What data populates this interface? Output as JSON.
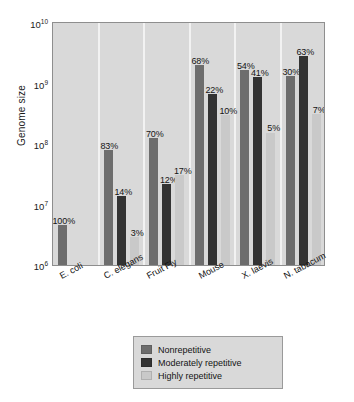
{
  "chart_data": {
    "type": "bar",
    "title": "",
    "xlabel": "",
    "ylabel": "Genome size",
    "yscale": "log",
    "ylim": [
      1000000,
      10000000000
    ],
    "ytick_labels": [
      "10^10",
      "10^9",
      "10^8",
      "10^7",
      "10^6"
    ],
    "ytick_mantissa": [
      "10",
      "10",
      "10",
      "10",
      "10"
    ],
    "ytick_exponent": [
      "10",
      "9",
      "8",
      "7",
      "6"
    ],
    "grid": false,
    "legend_position": "bottom-center",
    "categories": [
      "E. coli",
      "C. elegans",
      "Fruit Fly",
      "Mouse",
      "X. laevis",
      "N. tabacum"
    ],
    "genome_sizes": [
      4600000,
      97000000,
      180000000,
      3000000000,
      3100000000,
      4500000000
    ],
    "series": [
      {
        "name": "Nonrepetitive",
        "color": "#6d6d6d",
        "percent_labels": [
          "100%",
          "83%",
          "70%",
          "68%",
          "54%",
          "30%"
        ],
        "percents": [
          100,
          83,
          70,
          68,
          54,
          30
        ],
        "values": [
          4600000,
          80500000,
          126000000,
          2040000000,
          1674000000,
          1350000000
        ]
      },
      {
        "name": "Moderately repetitive",
        "color": "#333333",
        "percent_labels": [
          "",
          "14%",
          "12%",
          "22%",
          "41%",
          "63%"
        ],
        "percents": [
          0,
          14,
          12,
          22,
          41,
          63
        ],
        "values": [
          0,
          13580000,
          21600000,
          660000000,
          1271000000,
          2835000000
        ]
      },
      {
        "name": "Highly repetitive",
        "color": "#c9c9c9",
        "percent_labels": [
          "",
          "3%",
          "17%",
          "10%",
          "5%",
          "7%"
        ],
        "percents": [
          0,
          3,
          17,
          10,
          5,
          7
        ],
        "values": [
          0,
          2910000,
          30600000,
          300000000,
          155000000,
          315000000
        ]
      }
    ]
  },
  "legend": {
    "items": [
      {
        "label": "Nonrepetitive",
        "color": "#6d6d6d"
      },
      {
        "label": "Moderately repetitive",
        "color": "#333333"
      },
      {
        "label": "Highly repetitive",
        "color": "#c9c9c9"
      }
    ]
  }
}
